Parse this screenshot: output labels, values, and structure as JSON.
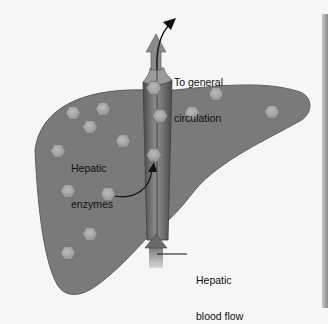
{
  "diagram": {
    "labels": {
      "general_circulation": [
        "To general",
        "circulation"
      ],
      "hepatic_enzymes": [
        "Hepatic",
        "enzymes"
      ],
      "hepatic_blood_flow": [
        "Hepatic",
        "blood flow"
      ]
    },
    "colors": {
      "background": "#f6f6f6",
      "liver": "#787878",
      "vessel": "#5a5a5a",
      "vessel_highlight": "#9a9a9a",
      "enzyme": "#a9a9a9",
      "arrow": "#111111",
      "edge_shadow": "#8a8a8a"
    },
    "enzyme_positions": [
      [
        73,
        113
      ],
      [
        103,
        109
      ],
      [
        90,
        127
      ],
      [
        123,
        141
      ],
      [
        58,
        151
      ],
      [
        68,
        191
      ],
      [
        108,
        194
      ],
      [
        90,
        234
      ],
      [
        68,
        253
      ],
      [
        154,
        88
      ],
      [
        160,
        116
      ],
      [
        154,
        155
      ],
      [
        216,
        94
      ],
      [
        192,
        113
      ],
      [
        272,
        112
      ]
    ]
  }
}
